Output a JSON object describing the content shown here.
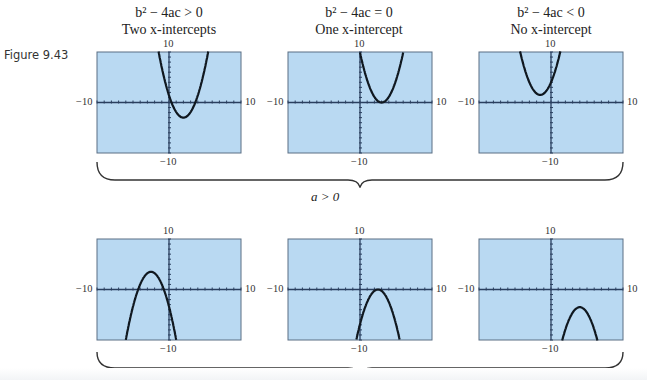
{
  "figure": {
    "label": "Figure 9.43",
    "top_condition_label": "a > 0",
    "bottom_condition_label": "",
    "colors": {
      "screen_bg": "#b9d9f2",
      "screen_border": "#5a6e84",
      "curve": "#101820",
      "axis": "#2a3f5f"
    },
    "columns": [
      {
        "condition": "b² − 4ac > 0",
        "description": "Two x-intercepts"
      },
      {
        "condition": "b² − 4ac = 0",
        "description": "One x-intercept"
      },
      {
        "condition": "b² − 4ac < 0",
        "description": "No x-intercept"
      }
    ],
    "window": {
      "xmin": "−10",
      "xmax": "10",
      "ymin": "−10",
      "ymax": "10"
    },
    "graphs": [
      {
        "row": "top",
        "col": 1,
        "curve": "upward parabola, vertex below x-axis (two intercepts)"
      },
      {
        "row": "top",
        "col": 2,
        "curve": "upward parabola, vertex on x-axis (one intercept)"
      },
      {
        "row": "top",
        "col": 3,
        "curve": "upward parabola, vertex above x-axis (no intercept)"
      },
      {
        "row": "bottom",
        "col": 1,
        "curve": "downward parabola, vertex above x-axis (two intercepts)"
      },
      {
        "row": "bottom",
        "col": 2,
        "curve": "downward parabola, vertex on x-axis (one intercept)"
      },
      {
        "row": "bottom",
        "col": 3,
        "curve": "downward parabola, vertex below x-axis (no intercept)"
      }
    ]
  }
}
